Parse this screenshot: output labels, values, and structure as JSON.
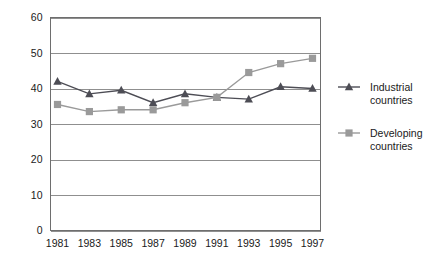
{
  "chart_data": {
    "type": "line",
    "title": "",
    "subtitle": "",
    "xlabel": "",
    "ylabel": "",
    "categories": [
      "1981",
      "1983",
      "1985",
      "1987",
      "1989",
      "1991",
      "1993",
      "1995",
      "1997"
    ],
    "ylim": [
      0,
      60
    ],
    "yticks": [
      "0",
      "10",
      "20",
      "30",
      "40",
      "50",
      "60"
    ],
    "ytick_values": [
      0,
      10,
      20,
      30,
      40,
      50,
      60
    ],
    "grid": "horizontal",
    "legend_position": "right",
    "series": [
      {
        "name": "Industrial countries",
        "marker": "triangle",
        "color": "#4d4d55",
        "values": [
          42.0,
          38.5,
          39.5,
          36.0,
          38.5,
          37.5,
          37.0,
          40.5,
          40.0
        ]
      },
      {
        "name": "Developing countries",
        "marker": "square",
        "color": "#9a9a9a",
        "values": [
          35.5,
          33.5,
          34.0,
          34.0,
          36.0,
          37.5,
          44.5,
          47.0,
          48.5
        ]
      }
    ]
  },
  "legend": {
    "items": [
      {
        "label_line1": "Industrial",
        "label_line2": "countries",
        "marker": "triangle-marker",
        "color": "#4d4d55"
      },
      {
        "label_line1": "Developing",
        "label_line2": "countries",
        "marker": "square-marker",
        "color": "#9a9a9a"
      }
    ]
  },
  "colors": {
    "industrial": "#4d4d55",
    "developing": "#9a9a9a",
    "gridline": "#8f8f8f",
    "frame": "#6e6e6e",
    "background": "#ffffff",
    "text": "#1a1a1a"
  }
}
